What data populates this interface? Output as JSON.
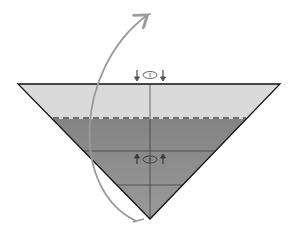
{
  "diagram": {
    "type": "origami-fold-step",
    "colors": {
      "background": "#ffffff",
      "paper_light": "#d9d9d9",
      "paper_dark": "#8a8a8a",
      "outline": "#1a1a1a",
      "dashed_fold": "#707070",
      "arrow": "#9a9a9a",
      "symbol": "#555555"
    },
    "triangle": {
      "top_left": [
        18,
        84
      ],
      "top_right": [
        280,
        84
      ],
      "apex": [
        150,
        219
      ]
    },
    "fold_line": {
      "y": 118,
      "x1": 53,
      "x2": 246,
      "style": "dashed"
    },
    "grid_lines": [
      151,
      185
    ],
    "symbols": [
      {
        "name": "turn-over-symbol-top",
        "x": 150,
        "y": 74,
        "arrows": "down"
      },
      {
        "name": "turn-over-symbol-bottom",
        "x": 150,
        "y": 159,
        "arrows": "up"
      }
    ],
    "arc_arrow": {
      "from": [
        138,
        220
      ],
      "to": [
        148,
        14
      ]
    }
  }
}
